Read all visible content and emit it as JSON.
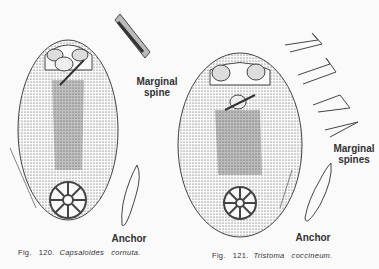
{
  "figure_120": {
    "caption_prefix": "Fig.   120.",
    "caption_species": "Capsaloides   cornuta.",
    "labels": {
      "marginal_spine_1": "Marginal",
      "marginal_spine_2": "spine",
      "anchor": "Anchor"
    }
  },
  "figure_121": {
    "caption_prefix": "Fig.   121.",
    "caption_species": "Tristoma   coccineum.",
    "labels": {
      "marginal_spines_1": "Marginal",
      "marginal_spines_2": "spines",
      "anchor": "Anchor"
    }
  }
}
